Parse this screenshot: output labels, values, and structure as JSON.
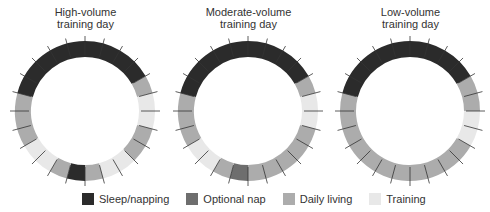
{
  "colors": {
    "sleep": "#2b2b2b",
    "optional_nap": "#6e6e6e",
    "daily": "#acacac",
    "training": "#e8e8e8",
    "tick": "#333333"
  },
  "panels": [
    {
      "title_line1": "High-volume",
      "title_line2": "training day"
    },
    {
      "title_line1": "Moderate-volume",
      "title_line2": "training day"
    },
    {
      "title_line1": "Low-volume",
      "title_line2": "training day"
    }
  ],
  "legend": [
    {
      "key": "sleep",
      "label": "Sleep/napping"
    },
    {
      "key": "optional_nap",
      "label": "Optional nap"
    },
    {
      "key": "daily",
      "label": "Daily living"
    },
    {
      "key": "training",
      "label": "Training"
    }
  ],
  "chart_data": {
    "type": "donut-24h",
    "units": "hours (24 segments, clockwise from top)",
    "categories": [
      "Sleep/napping",
      "Optional nap",
      "Daily living",
      "Training"
    ],
    "rings": [
      {
        "name": "High-volume training day",
        "segments": [
          {
            "start": 0,
            "end": 4,
            "type": "sleep"
          },
          {
            "start": 4,
            "end": 5,
            "type": "daily"
          },
          {
            "start": 5,
            "end": 7,
            "type": "training"
          },
          {
            "start": 7,
            "end": 9,
            "type": "daily"
          },
          {
            "start": 9,
            "end": 11,
            "type": "training"
          },
          {
            "start": 11,
            "end": 12,
            "type": "daily"
          },
          {
            "start": 12,
            "end": 13,
            "type": "sleep"
          },
          {
            "start": 13,
            "end": 14,
            "type": "daily"
          },
          {
            "start": 14,
            "end": 16,
            "type": "training"
          },
          {
            "start": 16,
            "end": 19,
            "type": "daily"
          },
          {
            "start": 19,
            "end": 24,
            "type": "sleep"
          }
        ]
      },
      {
        "name": "Moderate-volume training day",
        "segments": [
          {
            "start": 0,
            "end": 4,
            "type": "sleep"
          },
          {
            "start": 4,
            "end": 5,
            "type": "daily"
          },
          {
            "start": 5,
            "end": 7,
            "type": "training"
          },
          {
            "start": 7,
            "end": 12,
            "type": "daily"
          },
          {
            "start": 12,
            "end": 13,
            "type": "optional_nap"
          },
          {
            "start": 13,
            "end": 14,
            "type": "daily"
          },
          {
            "start": 14,
            "end": 16,
            "type": "training"
          },
          {
            "start": 16,
            "end": 19,
            "type": "daily"
          },
          {
            "start": 19,
            "end": 24,
            "type": "sleep"
          }
        ]
      },
      {
        "name": "Low-volume training day",
        "segments": [
          {
            "start": 0,
            "end": 4,
            "type": "sleep"
          },
          {
            "start": 4,
            "end": 6,
            "type": "daily"
          },
          {
            "start": 6,
            "end": 8,
            "type": "training"
          },
          {
            "start": 8,
            "end": 19,
            "type": "daily"
          },
          {
            "start": 19,
            "end": 24,
            "type": "sleep"
          }
        ]
      }
    ]
  }
}
